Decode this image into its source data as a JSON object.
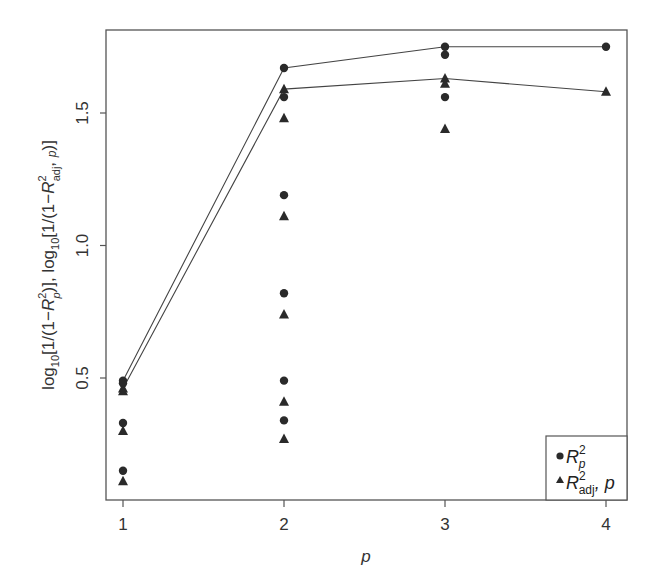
{
  "chart_data": {
    "type": "scatter",
    "title": "",
    "xlabel": "p",
    "ylabel": "log10[1/(1-R_p^2)], log10[1/(1-R_adj,p^2)]",
    "xlim": [
      0.9,
      4.15
    ],
    "ylim": [
      0.07,
      1.81
    ],
    "xticks": [
      1,
      2,
      3,
      4
    ],
    "xtick_labels": [
      "1",
      "2",
      "3",
      "4"
    ],
    "yticks": [
      0.5,
      1.0,
      1.5
    ],
    "ytick_labels": [
      "0.5",
      "1.0",
      "1.5"
    ],
    "grid": false,
    "legend_position": "lower right",
    "legend": [
      "R_p^2",
      "R_adj,p^2"
    ],
    "series": [
      {
        "name": "R_p^2",
        "marker": "circle",
        "points": [
          {
            "x": 1,
            "y": 0.49
          },
          {
            "x": 1,
            "y": 0.48
          },
          {
            "x": 1,
            "y": 0.33
          },
          {
            "x": 1,
            "y": 0.15
          },
          {
            "x": 2,
            "y": 1.67
          },
          {
            "x": 2,
            "y": 1.56
          },
          {
            "x": 2,
            "y": 1.19
          },
          {
            "x": 2,
            "y": 0.82
          },
          {
            "x": 2,
            "y": 0.49
          },
          {
            "x": 2,
            "y": 0.34
          },
          {
            "x": 3,
            "y": 1.75
          },
          {
            "x": 3,
            "y": 1.72
          },
          {
            "x": 3,
            "y": 1.56
          },
          {
            "x": 4,
            "y": 1.75
          }
        ],
        "max_line": [
          {
            "x": 1,
            "y": 0.49
          },
          {
            "x": 2,
            "y": 1.67
          },
          {
            "x": 3,
            "y": 1.75
          },
          {
            "x": 4,
            "y": 1.75
          }
        ]
      },
      {
        "name": "R_adj,p^2",
        "marker": "triangle",
        "points": [
          {
            "x": 1,
            "y": 0.46
          },
          {
            "x": 1,
            "y": 0.45
          },
          {
            "x": 1,
            "y": 0.3
          },
          {
            "x": 1,
            "y": 0.11
          },
          {
            "x": 2,
            "y": 1.59
          },
          {
            "x": 2,
            "y": 1.48
          },
          {
            "x": 2,
            "y": 1.11
          },
          {
            "x": 2,
            "y": 0.74
          },
          {
            "x": 2,
            "y": 0.41
          },
          {
            "x": 2,
            "y": 0.27
          },
          {
            "x": 3,
            "y": 1.63
          },
          {
            "x": 3,
            "y": 1.61
          },
          {
            "x": 3,
            "y": 1.44
          },
          {
            "x": 4,
            "y": 1.58
          }
        ],
        "max_line": [
          {
            "x": 1,
            "y": 0.46
          },
          {
            "x": 2,
            "y": 1.59
          },
          {
            "x": 3,
            "y": 1.63
          },
          {
            "x": 4,
            "y": 1.58
          }
        ]
      }
    ]
  },
  "labels": {
    "xlabel": "p",
    "yticks": [
      "0.5",
      "1.0",
      "1.5"
    ],
    "xticks": [
      "1",
      "2",
      "3",
      "4"
    ],
    "legend_r": "R",
    "legend_r_sup": "2",
    "legend_r_sub": "p",
    "legend_adj": "R",
    "legend_adj_sup": "2",
    "legend_adj_sub": "adj",
    "legend_adj_tail": ", p"
  },
  "colors": {
    "ink": "#2a2a2a",
    "frame": "#555555",
    "line": "#444444"
  }
}
